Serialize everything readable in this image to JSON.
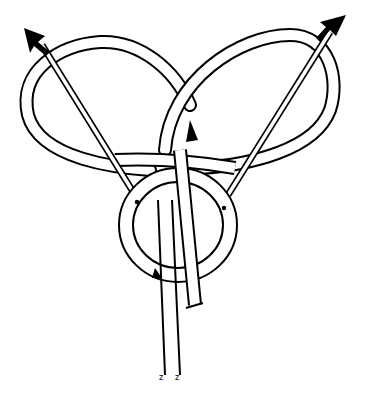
{
  "diagram": {
    "type": "knot-illustration",
    "arrows": [
      {
        "name": "left-arrow",
        "direction": "up-left"
      },
      {
        "name": "right-arrow",
        "direction": "up-right"
      }
    ],
    "colors": {
      "line": "#000000",
      "background": "#ffffff"
    }
  }
}
